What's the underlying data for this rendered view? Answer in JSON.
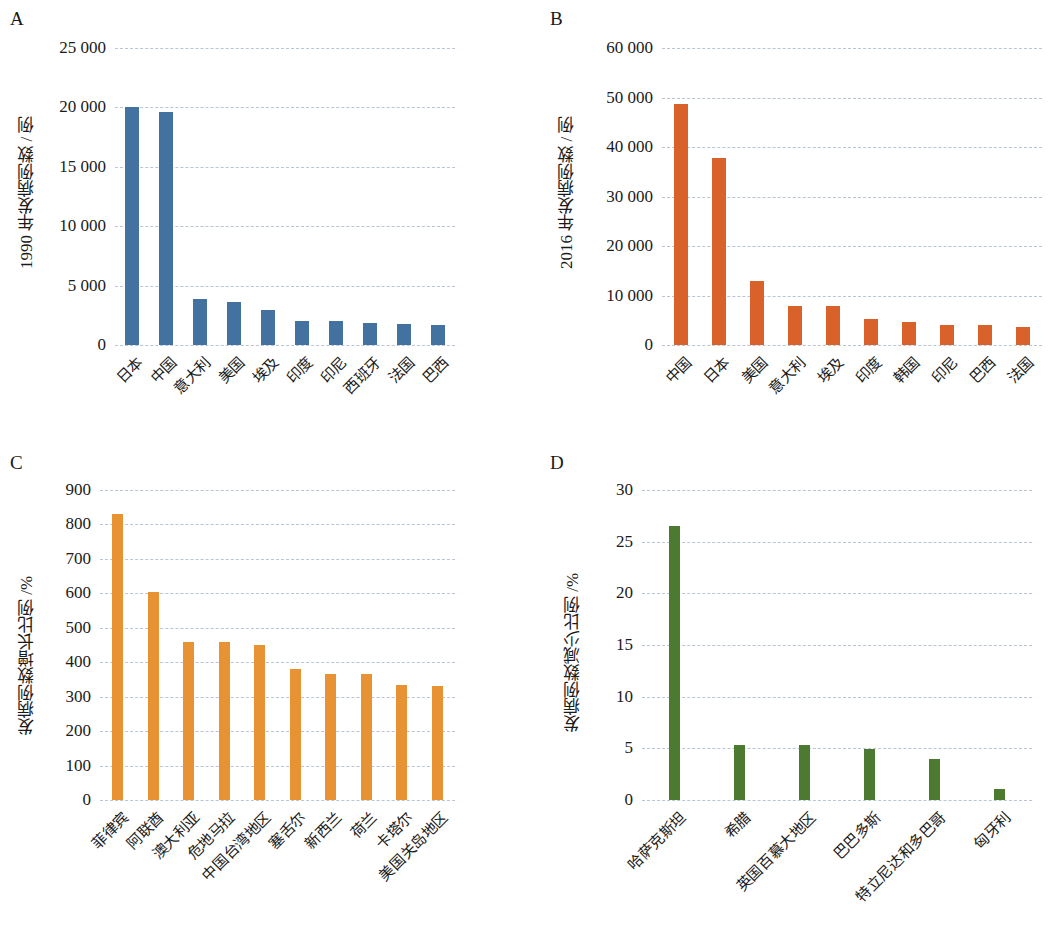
{
  "figure": {
    "panels": [
      "A",
      "B",
      "C",
      "D"
    ]
  },
  "panelA": {
    "letter": "A",
    "ylabel": "1990 年发病例数 / 例",
    "color": "#4372a0"
  },
  "panelB": {
    "letter": "B",
    "ylabel": "2016 年发病例数 / 例",
    "color": "#d9622b"
  },
  "panelC": {
    "letter": "C",
    "ylabel": "发病例数增长比例 /%",
    "color": "#e79334"
  },
  "panelD": {
    "letter": "D",
    "ylabel": "发病例数减少比例 /%",
    "color": "#4c7a31"
  },
  "chart_data": [
    {
      "type": "bar",
      "panel": "A",
      "title": "",
      "xlabel": "",
      "ylabel": "1990 年发病例数 / 例",
      "ylim": [
        0,
        25000
      ],
      "yticks": [
        0,
        5000,
        10000,
        15000,
        20000,
        25000
      ],
      "ytick_labels": [
        "0",
        "5 000",
        "10 000",
        "15 000",
        "20 000",
        "25 000"
      ],
      "grid": true,
      "legend": "none",
      "color": "#4372a0",
      "categories": [
        "日本",
        "中国",
        "意大利",
        "美国",
        "埃及",
        "印度",
        "印尼",
        "西班牙",
        "法国",
        "巴西"
      ],
      "values": [
        20000,
        19650,
        3850,
        3650,
        2950,
        2050,
        1980,
        1850,
        1800,
        1700
      ]
    },
    {
      "type": "bar",
      "panel": "B",
      "title": "",
      "xlabel": "",
      "ylabel": "2016 年发病例数 / 例",
      "ylim": [
        0,
        60000
      ],
      "yticks": [
        0,
        10000,
        20000,
        30000,
        40000,
        50000,
        60000
      ],
      "ytick_labels": [
        "0",
        "10 000",
        "20 000",
        "30 000",
        "40 000",
        "50 000",
        "60 000"
      ],
      "grid": true,
      "legend": "none",
      "color": "#d9622b",
      "categories": [
        "中国",
        "日本",
        "美国",
        "意大利",
        "埃及",
        "印度",
        "韩国",
        "印尼",
        "巴西",
        "法国"
      ],
      "values": [
        48700,
        37800,
        13000,
        7800,
        7800,
        5200,
        4600,
        4100,
        4100,
        3600
      ]
    },
    {
      "type": "bar",
      "panel": "C",
      "title": "",
      "xlabel": "",
      "ylabel": "发病例数增长比例 /%",
      "ylim": [
        0,
        900
      ],
      "yticks": [
        0,
        100,
        200,
        300,
        400,
        500,
        600,
        700,
        800,
        900
      ],
      "ytick_labels": [
        "0",
        "100",
        "200",
        "300",
        "400",
        "500",
        "600",
        "700",
        "800",
        "900"
      ],
      "grid": true,
      "legend": "none",
      "color": "#e79334",
      "categories": [
        "菲律宾",
        "阿联酋",
        "澳大利亚",
        "危地马拉",
        "中国台湾地区",
        "塞舌尔",
        "新西兰",
        "荷兰",
        "卡塔尔",
        "美国关岛地区"
      ],
      "values": [
        830,
        605,
        460,
        460,
        450,
        380,
        365,
        365,
        335,
        330
      ]
    },
    {
      "type": "bar",
      "panel": "D",
      "title": "",
      "xlabel": "",
      "ylabel": "发病例数减少比例 /%",
      "ylim": [
        0,
        30
      ],
      "yticks": [
        0,
        5,
        10,
        15,
        20,
        25,
        30
      ],
      "ytick_labels": [
        "0",
        "5",
        "10",
        "15",
        "20",
        "25",
        "30"
      ],
      "grid": true,
      "legend": "none",
      "color": "#4c7a31",
      "categories": [
        "哈萨克斯坦",
        "希腊",
        "英国百慕大地区",
        "巴巴多斯",
        "特立尼达和多巴哥",
        "匈牙利"
      ],
      "values": [
        26.5,
        5.3,
        5.3,
        4.9,
        4.0,
        1.1
      ]
    }
  ]
}
